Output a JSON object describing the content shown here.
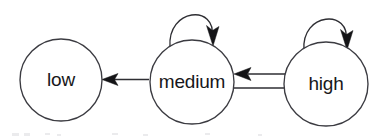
{
  "figure": {
    "kind": "state-transition-diagram",
    "background_color": "#ffffff",
    "stroke_color": "#2e2e33",
    "label_color": "#17171a",
    "width": 376,
    "height": 140
  },
  "nodes": [
    {
      "id": "low",
      "label": "low",
      "cx": 61,
      "cy": 80,
      "r": 41
    },
    {
      "id": "medium",
      "label": "medium",
      "cx": 192,
      "cy": 82,
      "r": 42
    },
    {
      "id": "high",
      "label": "high",
      "cx": 326,
      "cy": 84,
      "r": 42
    }
  ],
  "edges": [
    {
      "id": "medium-to-low",
      "from": "medium",
      "to": "low",
      "label": "",
      "direction": "left"
    },
    {
      "id": "high-to-medium",
      "from": "high",
      "to": "medium",
      "label": "",
      "direction": "left"
    },
    {
      "id": "medium-to-high",
      "from": "medium",
      "to": "high",
      "label": "",
      "direction": "right"
    },
    {
      "id": "medium-self-loop",
      "from": "medium",
      "to": "medium",
      "label": "",
      "direction": "self"
    },
    {
      "id": "high-self-loop",
      "from": "high",
      "to": "high",
      "label": "",
      "direction": "self"
    }
  ]
}
